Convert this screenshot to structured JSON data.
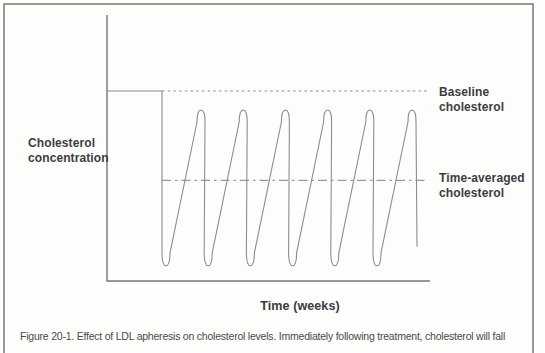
{
  "figure": {
    "caption": "Figure 20-1. Effect of LDL apheresis on cholesterol levels. Immediately following treatment, cholesterol will fall"
  },
  "chart": {
    "ylabel": "Cholesterol concentration",
    "xlabel": "Time (weeks)",
    "baseline_label": "Baseline cholesterol",
    "time_averaged_label": "Time-averaged cholesterol"
  },
  "chart_data": {
    "type": "line",
    "title": "",
    "xlabel": "Time (weeks)",
    "ylabel": "Cholesterol concentration",
    "x_ticks": [],
    "y_ticks": [],
    "axes_unlabeled_numerically": true,
    "baseline_level": 1.0,
    "peak_level": 0.9,
    "trough_level": 0.08,
    "time_averaged_level": 0.53,
    "final_drop_end_level": 0.18,
    "treatment_cycles": 6,
    "reference_lines": [
      {
        "label": "Baseline cholesterol",
        "level": 1.0,
        "style": "dotted"
      },
      {
        "label": "Time-averaged cholesterol",
        "level": 0.53,
        "style": "dash-dot"
      }
    ]
  },
  "colors": {
    "curve": "#8c8c8c",
    "axis": "#767676",
    "dotted_line": "#8a8a8a",
    "dash_dot_line": "#9a9a9a",
    "text": "#3c3c3c",
    "caption_text": "#4a4a4a",
    "border": "#9b9792",
    "background": "#fdfdfc"
  }
}
